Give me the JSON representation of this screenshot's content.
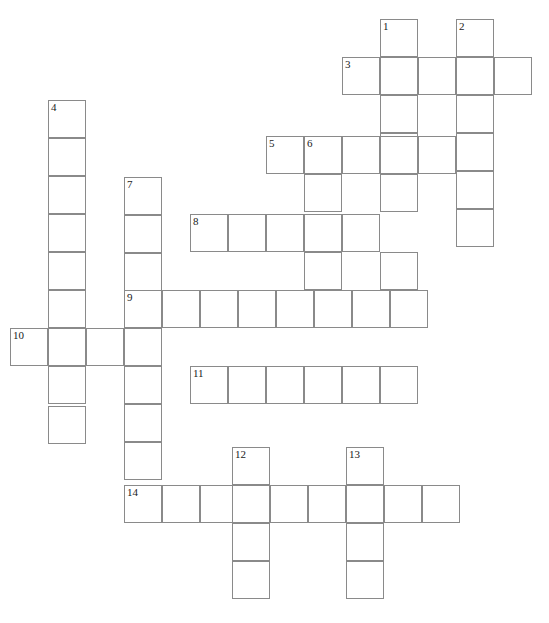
{
  "puzzle": {
    "title": "Crossword Puzzle Grid",
    "cell_size": 38,
    "grid_width": 549,
    "grid_height": 623,
    "cell_border_color": "#8a8a8a",
    "cell_fill_color": "#ffffff",
    "number_color": "#1a1a1a",
    "background_color": "#ffffff",
    "clue_numbers": [
      1,
      2,
      3,
      4,
      5,
      6,
      7,
      8,
      9,
      10,
      11,
      12,
      13,
      14
    ],
    "entries": [
      {
        "number": 1,
        "direction": "down",
        "x": 380,
        "y": 19,
        "length": 6
      },
      {
        "number": 2,
        "direction": "down",
        "x": 456,
        "y": 19,
        "length": 6
      },
      {
        "number": 3,
        "direction": "across",
        "x": 342,
        "y": 57,
        "length": 5
      },
      {
        "number": 4,
        "direction": "down",
        "x": 48,
        "y": 100,
        "length": 9
      },
      {
        "number": 5,
        "direction": "across",
        "x": 266,
        "y": 136,
        "length": 4
      },
      {
        "number": 6,
        "direction": "down",
        "x": 304,
        "y": 136,
        "length": 4
      },
      {
        "number": 7,
        "direction": "down",
        "x": 124,
        "y": 177,
        "length": 8
      },
      {
        "number": 8,
        "direction": "across",
        "x": 190,
        "y": 214,
        "length": 5
      },
      {
        "number": 9,
        "direction": "across",
        "x": 124,
        "y": 290,
        "length": 8
      },
      {
        "number": 10,
        "direction": "across",
        "x": 10,
        "y": 328,
        "length": 4
      },
      {
        "number": 11,
        "direction": "across",
        "x": 190,
        "y": 366,
        "length": 6
      },
      {
        "number": 12,
        "direction": "down",
        "x": 232,
        "y": 447,
        "length": 4
      },
      {
        "number": 13,
        "direction": "down",
        "x": 346,
        "y": 447,
        "length": 4
      },
      {
        "number": 14,
        "direction": "across",
        "x": 124,
        "y": 485,
        "length": 9
      }
    ],
    "cells": [
      {
        "x": 380,
        "y": 19,
        "number": "1"
      },
      {
        "x": 456,
        "y": 19,
        "number": "2"
      },
      {
        "x": 380,
        "y": 57,
        "number": ""
      },
      {
        "x": 456,
        "y": 57,
        "number": ""
      },
      {
        "x": 342,
        "y": 57,
        "number": "3"
      },
      {
        "x": 418,
        "y": 57,
        "number": ""
      },
      {
        "x": 494,
        "y": 57,
        "number": ""
      },
      {
        "x": 380,
        "y": 95,
        "number": ""
      },
      {
        "x": 456,
        "y": 95,
        "number": ""
      },
      {
        "x": 48,
        "y": 100,
        "number": "4"
      },
      {
        "x": 48,
        "y": 138,
        "number": ""
      },
      {
        "x": 380,
        "y": 133,
        "number": ""
      },
      {
        "x": 456,
        "y": 133,
        "number": ""
      },
      {
        "x": 266,
        "y": 136,
        "number": "5"
      },
      {
        "x": 304,
        "y": 136,
        "number": "6"
      },
      {
        "x": 342,
        "y": 136,
        "number": ""
      },
      {
        "x": 380,
        "y": 136,
        "number": ""
      },
      {
        "x": 418,
        "y": 136,
        "number": ""
      },
      {
        "x": 48,
        "y": 176,
        "number": ""
      },
      {
        "x": 124,
        "y": 177,
        "number": "7"
      },
      {
        "x": 304,
        "y": 174,
        "number": ""
      },
      {
        "x": 380,
        "y": 174,
        "number": ""
      },
      {
        "x": 456,
        "y": 171,
        "number": ""
      },
      {
        "x": 48,
        "y": 214,
        "number": ""
      },
      {
        "x": 124,
        "y": 215,
        "number": ""
      },
      {
        "x": 190,
        "y": 214,
        "number": "8"
      },
      {
        "x": 228,
        "y": 214,
        "number": ""
      },
      {
        "x": 266,
        "y": 214,
        "number": ""
      },
      {
        "x": 304,
        "y": 214,
        "number": ""
      },
      {
        "x": 342,
        "y": 214,
        "number": ""
      },
      {
        "x": 456,
        "y": 209,
        "number": ""
      },
      {
        "x": 48,
        "y": 252,
        "number": ""
      },
      {
        "x": 124,
        "y": 253,
        "number": ""
      },
      {
        "x": 304,
        "y": 252,
        "number": ""
      },
      {
        "x": 380,
        "y": 252,
        "number": ""
      },
      {
        "x": 48,
        "y": 290,
        "number": ""
      },
      {
        "x": 124,
        "y": 290,
        "number": "9"
      },
      {
        "x": 162,
        "y": 290,
        "number": ""
      },
      {
        "x": 200,
        "y": 290,
        "number": ""
      },
      {
        "x": 238,
        "y": 290,
        "number": ""
      },
      {
        "x": 276,
        "y": 290,
        "number": ""
      },
      {
        "x": 314,
        "y": 290,
        "number": ""
      },
      {
        "x": 352,
        "y": 290,
        "number": ""
      },
      {
        "x": 390,
        "y": 290,
        "number": ""
      },
      {
        "x": 10,
        "y": 328,
        "number": "10"
      },
      {
        "x": 48,
        "y": 328,
        "number": ""
      },
      {
        "x": 86,
        "y": 328,
        "number": ""
      },
      {
        "x": 124,
        "y": 328,
        "number": ""
      },
      {
        "x": 48,
        "y": 366,
        "number": ""
      },
      {
        "x": 124,
        "y": 366,
        "number": ""
      },
      {
        "x": 190,
        "y": 366,
        "number": "11"
      },
      {
        "x": 228,
        "y": 366,
        "number": ""
      },
      {
        "x": 266,
        "y": 366,
        "number": ""
      },
      {
        "x": 304,
        "y": 366,
        "number": ""
      },
      {
        "x": 342,
        "y": 366,
        "number": ""
      },
      {
        "x": 380,
        "y": 366,
        "number": ""
      },
      {
        "x": 48,
        "y": 406,
        "number": ""
      },
      {
        "x": 124,
        "y": 404,
        "number": ""
      },
      {
        "x": 124,
        "y": 442,
        "number": ""
      },
      {
        "x": 232,
        "y": 447,
        "number": "12"
      },
      {
        "x": 346,
        "y": 447,
        "number": "13"
      },
      {
        "x": 124,
        "y": 485,
        "number": "14"
      },
      {
        "x": 162,
        "y": 485,
        "number": ""
      },
      {
        "x": 200,
        "y": 485,
        "number": ""
      },
      {
        "x": 232,
        "y": 485,
        "number": ""
      },
      {
        "x": 270,
        "y": 485,
        "number": ""
      },
      {
        "x": 308,
        "y": 485,
        "number": ""
      },
      {
        "x": 346,
        "y": 485,
        "number": ""
      },
      {
        "x": 384,
        "y": 485,
        "number": ""
      },
      {
        "x": 422,
        "y": 485,
        "number": ""
      },
      {
        "x": 232,
        "y": 523,
        "number": ""
      },
      {
        "x": 346,
        "y": 523,
        "number": ""
      },
      {
        "x": 232,
        "y": 561,
        "number": ""
      },
      {
        "x": 346,
        "y": 561,
        "number": ""
      }
    ]
  }
}
